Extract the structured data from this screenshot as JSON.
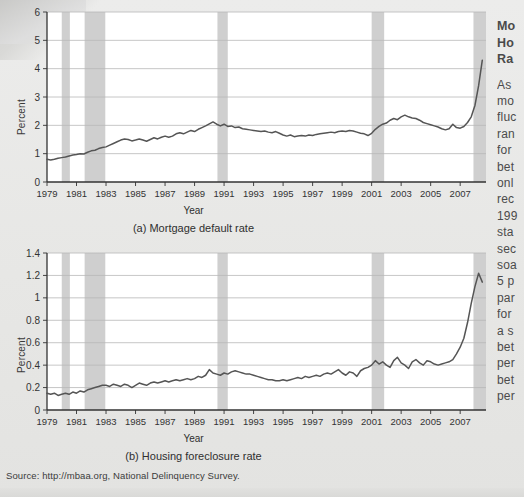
{
  "figure": {
    "source_note": "Source: http://mbaa.org, National Delinquency Survey."
  },
  "side_panel": {
    "clipped": true,
    "heading_lines": [
      "Mo",
      "Ho",
      "Ra"
    ],
    "body_lines": [
      "As",
      "mo",
      "fluc",
      "ran",
      "for",
      "bet",
      "onl",
      "rec",
      "199",
      "sta",
      "sec",
      "soa",
      "5 p",
      "par",
      "for",
      "a s",
      "bet",
      "per",
      "bet",
      "per"
    ]
  },
  "chart_data": [
    {
      "type": "line",
      "id": "mortgage-default-rate",
      "title": "(a) Mortgage default rate",
      "xlabel": "Year",
      "ylabel": "Percent",
      "xlim": [
        1979,
        2008.75
      ],
      "ylim": [
        0,
        6
      ],
      "yticks": [
        0,
        1,
        2,
        3,
        4,
        5,
        6
      ],
      "xticks": [
        1979,
        1981,
        1983,
        1985,
        1987,
        1989,
        1991,
        1993,
        1995,
        1997,
        1999,
        2001,
        2003,
        2005,
        2007
      ],
      "grid": "horizontal",
      "line_color": "#555555",
      "shade_color": "#cfcfcf",
      "recession_bands": [
        [
          1980.0,
          1980.55
        ],
        [
          1981.55,
          1982.95
        ],
        [
          1990.55,
          1991.25
        ],
        [
          2001.0,
          2001.85
        ],
        [
          2007.9,
          2008.75
        ]
      ],
      "x": [
        1979.0,
        1979.25,
        1979.5,
        1979.75,
        1980.0,
        1980.25,
        1980.5,
        1980.75,
        1981.0,
        1981.25,
        1981.5,
        1981.75,
        1982.0,
        1982.25,
        1982.5,
        1982.75,
        1983.0,
        1983.25,
        1983.5,
        1983.75,
        1984.0,
        1984.25,
        1984.5,
        1984.75,
        1985.0,
        1985.25,
        1985.5,
        1985.75,
        1986.0,
        1986.25,
        1986.5,
        1986.75,
        1987.0,
        1987.25,
        1987.5,
        1987.75,
        1988.0,
        1988.25,
        1988.5,
        1988.75,
        1989.0,
        1989.25,
        1989.5,
        1989.75,
        1990.0,
        1990.25,
        1990.5,
        1990.75,
        1991.0,
        1991.25,
        1991.5,
        1991.75,
        1992.0,
        1992.25,
        1992.5,
        1992.75,
        1993.0,
        1993.25,
        1993.5,
        1993.75,
        1994.0,
        1994.25,
        1994.5,
        1994.75,
        1995.0,
        1995.25,
        1995.5,
        1995.75,
        1996.0,
        1996.25,
        1996.5,
        1996.75,
        1997.0,
        1997.25,
        1997.5,
        1997.75,
        1998.0,
        1998.25,
        1998.5,
        1998.75,
        1999.0,
        1999.25,
        1999.5,
        1999.75,
        2000.0,
        2000.25,
        2000.5,
        2000.75,
        2001.0,
        2001.25,
        2001.5,
        2001.75,
        2002.0,
        2002.25,
        2002.5,
        2002.75,
        2003.0,
        2003.25,
        2003.5,
        2003.75,
        2004.0,
        2004.25,
        2004.5,
        2004.75,
        2005.0,
        2005.25,
        2005.5,
        2005.75,
        2006.0,
        2006.25,
        2006.5,
        2006.75,
        2007.0,
        2007.25,
        2007.5,
        2007.75,
        2008.0,
        2008.25,
        2008.5
      ],
      "values": [
        0.8,
        0.78,
        0.8,
        0.84,
        0.86,
        0.88,
        0.92,
        0.95,
        0.97,
        1.0,
        0.99,
        1.05,
        1.1,
        1.12,
        1.18,
        1.22,
        1.24,
        1.3,
        1.36,
        1.42,
        1.48,
        1.52,
        1.5,
        1.45,
        1.48,
        1.52,
        1.48,
        1.44,
        1.5,
        1.56,
        1.52,
        1.58,
        1.62,
        1.58,
        1.62,
        1.7,
        1.74,
        1.7,
        1.76,
        1.82,
        1.78,
        1.86,
        1.92,
        1.98,
        2.05,
        2.12,
        2.04,
        1.98,
        2.04,
        1.96,
        1.98,
        1.92,
        1.94,
        1.88,
        1.86,
        1.84,
        1.82,
        1.8,
        1.78,
        1.8,
        1.76,
        1.74,
        1.78,
        1.72,
        1.66,
        1.62,
        1.66,
        1.6,
        1.62,
        1.64,
        1.62,
        1.66,
        1.64,
        1.68,
        1.7,
        1.72,
        1.74,
        1.76,
        1.74,
        1.78,
        1.8,
        1.78,
        1.82,
        1.8,
        1.76,
        1.72,
        1.7,
        1.64,
        1.72,
        1.86,
        1.96,
        2.04,
        2.08,
        2.18,
        2.24,
        2.2,
        2.3,
        2.36,
        2.3,
        2.26,
        2.24,
        2.18,
        2.1,
        2.06,
        2.02,
        1.98,
        1.94,
        1.88,
        1.84,
        1.88,
        2.04,
        1.92,
        1.9,
        1.96,
        2.1,
        2.3,
        2.7,
        3.4,
        4.3,
        5.2
      ],
      "annotations": {
        "start_value": 0.8,
        "peak_1987": 2.1,
        "peak_2002": 2.4,
        "trough_2006": 1.85,
        "end_value": 5.2
      }
    },
    {
      "type": "line",
      "id": "housing-foreclosure-rate",
      "title": "(b) Housing foreclosure rate",
      "xlabel": "Year",
      "ylabel": "Percent",
      "xlim": [
        1979,
        2008.75
      ],
      "ylim": [
        0,
        1.4
      ],
      "yticks": [
        0,
        0.2,
        0.4,
        0.6,
        0.8,
        1,
        1.2,
        1.4
      ],
      "ytick_labels": [
        "0",
        "0.2",
        "0.4",
        "0.6",
        "0.8",
        "1",
        "1.2",
        "1.4"
      ],
      "xticks": [
        1979,
        1981,
        1983,
        1985,
        1987,
        1989,
        1991,
        1993,
        1995,
        1997,
        1999,
        2001,
        2003,
        2005,
        2007
      ],
      "grid": "horizontal",
      "line_color": "#555555",
      "shade_color": "#cfcfcf",
      "recession_bands": [
        [
          1980.0,
          1980.55
        ],
        [
          1981.55,
          1982.95
        ],
        [
          1990.55,
          1991.25
        ],
        [
          2001.0,
          2001.85
        ],
        [
          2007.9,
          2008.75
        ]
      ],
      "x": [
        1979.0,
        1979.25,
        1979.5,
        1979.75,
        1980.0,
        1980.25,
        1980.5,
        1980.75,
        1981.0,
        1981.25,
        1981.5,
        1981.75,
        1982.0,
        1982.25,
        1982.5,
        1982.75,
        1983.0,
        1983.25,
        1983.5,
        1983.75,
        1984.0,
        1984.25,
        1984.5,
        1984.75,
        1985.0,
        1985.25,
        1985.5,
        1985.75,
        1986.0,
        1986.25,
        1986.5,
        1986.75,
        1987.0,
        1987.25,
        1987.5,
        1987.75,
        1988.0,
        1988.25,
        1988.5,
        1988.75,
        1989.0,
        1989.25,
        1989.5,
        1989.75,
        1990.0,
        1990.25,
        1990.5,
        1990.75,
        1991.0,
        1991.25,
        1991.5,
        1991.75,
        1992.0,
        1992.25,
        1992.5,
        1992.75,
        1993.0,
        1993.25,
        1993.5,
        1993.75,
        1994.0,
        1994.25,
        1994.5,
        1994.75,
        1995.0,
        1995.25,
        1995.5,
        1995.75,
        1996.0,
        1996.25,
        1996.5,
        1996.75,
        1997.0,
        1997.25,
        1997.5,
        1997.75,
        1998.0,
        1998.25,
        1998.5,
        1998.75,
        1999.0,
        1999.25,
        1999.5,
        1999.75,
        2000.0,
        2000.25,
        2000.5,
        2000.75,
        2001.0,
        2001.25,
        2001.5,
        2001.75,
        2002.0,
        2002.25,
        2002.5,
        2002.75,
        2003.0,
        2003.25,
        2003.5,
        2003.75,
        2004.0,
        2004.25,
        2004.5,
        2004.75,
        2005.0,
        2005.25,
        2005.5,
        2005.75,
        2006.0,
        2006.25,
        2006.5,
        2006.75,
        2007.0,
        2007.25,
        2007.5,
        2007.75,
        2008.0,
        2008.25,
        2008.5
      ],
      "values": [
        0.15,
        0.14,
        0.15,
        0.13,
        0.14,
        0.15,
        0.14,
        0.16,
        0.15,
        0.17,
        0.16,
        0.18,
        0.19,
        0.2,
        0.21,
        0.22,
        0.22,
        0.21,
        0.23,
        0.22,
        0.21,
        0.23,
        0.22,
        0.2,
        0.22,
        0.24,
        0.23,
        0.22,
        0.24,
        0.25,
        0.24,
        0.25,
        0.26,
        0.25,
        0.26,
        0.27,
        0.26,
        0.27,
        0.28,
        0.27,
        0.28,
        0.3,
        0.29,
        0.31,
        0.36,
        0.33,
        0.32,
        0.31,
        0.33,
        0.32,
        0.34,
        0.35,
        0.34,
        0.33,
        0.32,
        0.32,
        0.31,
        0.3,
        0.29,
        0.28,
        0.27,
        0.27,
        0.26,
        0.26,
        0.27,
        0.26,
        0.27,
        0.28,
        0.29,
        0.28,
        0.3,
        0.29,
        0.3,
        0.31,
        0.3,
        0.32,
        0.33,
        0.32,
        0.34,
        0.36,
        0.33,
        0.31,
        0.34,
        0.33,
        0.3,
        0.35,
        0.37,
        0.38,
        0.4,
        0.44,
        0.41,
        0.43,
        0.4,
        0.38,
        0.44,
        0.47,
        0.42,
        0.4,
        0.37,
        0.43,
        0.45,
        0.42,
        0.4,
        0.44,
        0.43,
        0.41,
        0.4,
        0.41,
        0.42,
        0.43,
        0.45,
        0.5,
        0.56,
        0.64,
        0.78,
        0.95,
        1.1,
        1.22,
        1.14
      ],
      "annotations": {
        "start_value": 0.15,
        "level_1990": 0.36,
        "level_2002": 0.47,
        "end_value": 1.22
      }
    }
  ]
}
